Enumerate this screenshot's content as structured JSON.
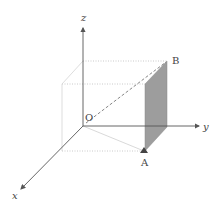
{
  "diagram": {
    "type": "3d-coordinate-axes",
    "colors": {
      "axis": "#555555",
      "box_edge": "#d0d0d0",
      "dotted_edge": "#bdbdbd",
      "panel_fill": "#9a9a9a",
      "dashed_ob": "#666666",
      "label": "#444444"
    },
    "labels": {
      "z_axis": "z",
      "y_axis": "y",
      "x_axis": "x",
      "origin": "O",
      "point_a": "A",
      "point_b": "B"
    }
  }
}
